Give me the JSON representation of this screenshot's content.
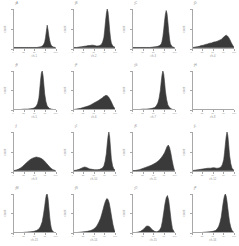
{
  "figure": {
    "title": "",
    "background": "#ffffff",
    "axis_color": "#a8a8a8",
    "fill_color": "#3a3a3a",
    "rows": 4,
    "cols": 4,
    "panel_count": 16
  },
  "chart_data": {
    "type": "area",
    "title": "",
    "xlabel": "",
    "ylabel": "",
    "grid": false,
    "legend": false,
    "layout": {
      "rows": 4,
      "cols": 4
    },
    "shared_axis": {
      "xlim": [
        0,
        100
      ],
      "ylim": [
        0,
        100
      ]
    },
    "panels": [
      {
        "id": "panel-1",
        "title": "A",
        "xlabel": "ch-1",
        "ylabel": "count",
        "ytop": "1",
        "xticks": [
          "0",
          "25",
          "50",
          "75",
          "100"
        ],
        "xtick_pos": [
          0,
          25,
          50,
          75,
          100
        ],
        "x": [
          0,
          5,
          10,
          15,
          20,
          25,
          30,
          35,
          40,
          45,
          50,
          55,
          60,
          65,
          68,
          71,
          74,
          76,
          78,
          80,
          82,
          84,
          86,
          88,
          90,
          92,
          95,
          100
        ],
        "y": [
          0,
          0,
          0,
          0,
          0,
          0,
          0,
          0,
          0,
          0,
          0,
          0,
          1,
          2,
          4,
          7,
          14,
          26,
          42,
          58,
          46,
          30,
          18,
          10,
          5,
          3,
          1,
          0
        ]
      },
      {
        "id": "panel-2",
        "title": "B",
        "xlabel": "ch-2",
        "ylabel": "count",
        "ytop": "1",
        "xticks": [
          "0",
          "25",
          "50",
          "75",
          "100"
        ],
        "xtick_pos": [
          0,
          25,
          50,
          75,
          100
        ],
        "x": [
          0,
          6,
          12,
          18,
          24,
          30,
          34,
          38,
          42,
          46,
          50,
          54,
          58,
          62,
          66,
          69,
          72,
          74,
          76,
          78,
          80,
          82,
          84,
          86,
          88,
          90,
          94,
          100
        ],
        "y": [
          0,
          0,
          1,
          2,
          3,
          4,
          5,
          5,
          6,
          6,
          5,
          4,
          4,
          5,
          8,
          14,
          26,
          45,
          68,
          88,
          100,
          92,
          70,
          44,
          24,
          11,
          3,
          0
        ]
      },
      {
        "id": "panel-3",
        "title": "C",
        "xlabel": "ch-3",
        "ylabel": "count",
        "ytop": "1",
        "xticks": [
          "0",
          "25",
          "50",
          "75",
          "100"
        ],
        "xtick_pos": [
          0,
          25,
          50,
          75,
          100
        ],
        "x": [
          0,
          8,
          16,
          24,
          32,
          40,
          48,
          54,
          60,
          64,
          68,
          70,
          72,
          74,
          76,
          78,
          80,
          82,
          84,
          86,
          88,
          90,
          93,
          96,
          100
        ],
        "y": [
          0,
          0,
          0,
          0,
          0,
          0,
          1,
          2,
          3,
          5,
          9,
          16,
          28,
          46,
          68,
          86,
          96,
          88,
          66,
          42,
          22,
          10,
          4,
          1,
          0
        ]
      },
      {
        "id": "panel-4",
        "title": "D",
        "xlabel": "ch-4",
        "ylabel": "count",
        "ytop": "1",
        "xticks": [
          "0",
          "25",
          "50",
          "75",
          "100"
        ],
        "xtick_pos": [
          0,
          25,
          50,
          75,
          100
        ],
        "x": [
          0,
          5,
          10,
          15,
          20,
          25,
          30,
          35,
          40,
          45,
          50,
          55,
          60,
          64,
          68,
          71,
          74,
          77,
          80,
          83,
          86,
          89,
          92,
          95,
          98,
          100
        ],
        "y": [
          0,
          1,
          2,
          3,
          5,
          6,
          8,
          9,
          11,
          12,
          14,
          15,
          17,
          19,
          21,
          24,
          27,
          30,
          32,
          30,
          26,
          20,
          13,
          7,
          2,
          0
        ]
      },
      {
        "id": "panel-5",
        "title": "E",
        "xlabel": "ch-5",
        "ylabel": "count",
        "ytop": "1",
        "xticks": [
          "0",
          "25",
          "50",
          "75",
          "100"
        ],
        "xtick_pos": [
          0,
          25,
          50,
          75,
          100
        ],
        "x": [
          0,
          8,
          16,
          24,
          32,
          40,
          46,
          50,
          54,
          57,
          60,
          62,
          64,
          66,
          68,
          70,
          72,
          74,
          77,
          80,
          85,
          90,
          95,
          100
        ],
        "y": [
          0,
          0,
          0,
          1,
          1,
          2,
          3,
          5,
          9,
          16,
          30,
          52,
          76,
          95,
          100,
          88,
          64,
          40,
          20,
          9,
          3,
          1,
          0,
          0
        ]
      },
      {
        "id": "panel-6",
        "title": "F",
        "xlabel": "ch-6",
        "ylabel": "count",
        "ytop": "1",
        "xticks": [
          "0",
          "25",
          "50",
          "75",
          "100"
        ],
        "xtick_pos": [
          0,
          25,
          50,
          75,
          100
        ],
        "x": [
          0,
          5,
          10,
          16,
          22,
          28,
          34,
          40,
          45,
          50,
          55,
          60,
          64,
          68,
          71,
          74,
          77,
          80,
          83,
          86,
          89,
          92,
          95,
          98,
          100
        ],
        "y": [
          0,
          1,
          2,
          3,
          5,
          7,
          9,
          12,
          15,
          18,
          21,
          24,
          27,
          30,
          33,
          35,
          37,
          36,
          33,
          28,
          22,
          15,
          8,
          3,
          0
        ]
      },
      {
        "id": "panel-7",
        "title": "G",
        "xlabel": "ch-7",
        "ylabel": "count",
        "ytop": "1",
        "xticks": [
          "0",
          "25",
          "50",
          "75",
          "100"
        ],
        "xtick_pos": [
          0,
          25,
          50,
          75,
          100
        ],
        "x": [
          0,
          8,
          16,
          24,
          32,
          40,
          46,
          52,
          56,
          60,
          63,
          66,
          68,
          70,
          72,
          74,
          76,
          78,
          81,
          84,
          88,
          92,
          96,
          100
        ],
        "y": [
          0,
          0,
          0,
          1,
          1,
          2,
          3,
          5,
          9,
          17,
          30,
          50,
          72,
          90,
          100,
          92,
          72,
          48,
          26,
          12,
          5,
          2,
          0,
          0
        ]
      },
      {
        "id": "panel-8",
        "title": "H",
        "xlabel": "ch-8",
        "ylabel": "count",
        "ytop": "1",
        "xticks": [
          "0",
          "25",
          "50",
          "75",
          "100"
        ],
        "xtick_pos": [
          0,
          25,
          50,
          75,
          100
        ],
        "x": [
          0,
          25,
          50,
          75,
          100
        ],
        "y": [
          0,
          0,
          0,
          0,
          0
        ]
      },
      {
        "id": "panel-9",
        "title": "I",
        "xlabel": "ch-9",
        "ylabel": "count",
        "ytop": "1",
        "xticks": [
          "0",
          "25",
          "50",
          "75",
          "100"
        ],
        "xtick_pos": [
          0,
          25,
          50,
          75,
          100
        ],
        "x": [
          0,
          5,
          10,
          15,
          20,
          25,
          30,
          35,
          40,
          45,
          50,
          54,
          58,
          62,
          66,
          70,
          74,
          78,
          82,
          86,
          90,
          94,
          97,
          100
        ],
        "y": [
          0,
          1,
          3,
          6,
          10,
          15,
          20,
          25,
          29,
          32,
          34,
          35,
          34,
          33,
          31,
          28,
          24,
          19,
          14,
          9,
          5,
          2,
          1,
          0
        ]
      },
      {
        "id": "panel-10",
        "title": "J",
        "xlabel": "ch-10",
        "ylabel": "count",
        "ytop": "1",
        "xticks": [
          "0",
          "25",
          "50",
          "75",
          "100"
        ],
        "xtick_pos": [
          0,
          25,
          50,
          75,
          100
        ],
        "x": [
          0,
          6,
          12,
          18,
          22,
          26,
          30,
          34,
          38,
          44,
          50,
          56,
          62,
          68,
          72,
          75,
          78,
          80,
          82,
          84,
          86,
          88,
          90,
          93,
          96,
          100
        ],
        "y": [
          0,
          1,
          3,
          6,
          8,
          9,
          8,
          6,
          4,
          3,
          2,
          2,
          3,
          6,
          12,
          24,
          44,
          68,
          88,
          100,
          86,
          58,
          30,
          12,
          4,
          0
        ]
      },
      {
        "id": "panel-11",
        "title": "K",
        "xlabel": "ch-11",
        "ylabel": "count",
        "ytop": "1",
        "xticks": [
          "0",
          "25",
          "50",
          "75",
          "100"
        ],
        "xtick_pos": [
          0,
          25,
          50,
          75,
          100
        ],
        "x": [
          0,
          5,
          10,
          15,
          20,
          25,
          30,
          35,
          40,
          45,
          50,
          55,
          60,
          64,
          68,
          72,
          76,
          79,
          82,
          85,
          88,
          91,
          94,
          97,
          100
        ],
        "y": [
          0,
          0,
          1,
          2,
          4,
          6,
          8,
          10,
          12,
          14,
          17,
          20,
          24,
          28,
          33,
          39,
          46,
          54,
          62,
          66,
          60,
          46,
          28,
          12,
          0
        ]
      },
      {
        "id": "panel-12",
        "title": "L",
        "xlabel": "ch-12",
        "ylabel": "count",
        "ytop": "1",
        "xticks": [
          "0",
          "25",
          "50",
          "75",
          "100"
        ],
        "xtick_pos": [
          0,
          25,
          50,
          75,
          100
        ],
        "x": [
          0,
          6,
          12,
          18,
          24,
          30,
          36,
          42,
          48,
          52,
          56,
          60,
          64,
          68,
          71,
          74,
          76,
          78,
          80,
          82,
          84,
          86,
          88,
          91,
          94,
          98,
          100
        ],
        "y": [
          0,
          1,
          2,
          3,
          4,
          5,
          6,
          6,
          7,
          7,
          6,
          6,
          7,
          10,
          16,
          28,
          46,
          68,
          88,
          100,
          90,
          66,
          40,
          18,
          6,
          1,
          0
        ]
      },
      {
        "id": "panel-13",
        "title": "M",
        "xlabel": "ch-13",
        "ylabel": "count",
        "ytop": "1",
        "xticks": [
          "0",
          "25",
          "50",
          "75",
          "100"
        ],
        "xtick_pos": [
          0,
          25,
          50,
          75,
          100
        ],
        "x": [
          0,
          10,
          20,
          30,
          40,
          48,
          54,
          60,
          64,
          68,
          71,
          74,
          76,
          78,
          80,
          82,
          84,
          86,
          88,
          90,
          92,
          95,
          98,
          100
        ],
        "y": [
          0,
          0,
          0,
          1,
          2,
          3,
          5,
          9,
          16,
          28,
          46,
          68,
          86,
          98,
          100,
          88,
          64,
          40,
          22,
          11,
          5,
          2,
          0,
          0
        ]
      },
      {
        "id": "panel-14",
        "title": "N",
        "xlabel": "ch-14",
        "ylabel": "count",
        "ytop": "1",
        "xticks": [
          "0",
          "25",
          "50",
          "75",
          "100"
        ],
        "xtick_pos": [
          0,
          25,
          50,
          75,
          100
        ],
        "x": [
          0,
          8,
          16,
          24,
          32,
          40,
          46,
          52,
          56,
          60,
          64,
          67,
          70,
          73,
          76,
          79,
          82,
          85,
          88,
          91,
          94,
          97,
          100
        ],
        "y": [
          0,
          0,
          1,
          2,
          3,
          5,
          8,
          13,
          19,
          27,
          37,
          48,
          60,
          72,
          82,
          88,
          86,
          76,
          58,
          38,
          20,
          7,
          0
        ]
      },
      {
        "id": "panel-15",
        "title": "O",
        "xlabel": "ch-15",
        "ylabel": "count",
        "ytop": "1",
        "xticks": [
          "0",
          "25",
          "50",
          "75",
          "100"
        ],
        "xtick_pos": [
          0,
          25,
          50,
          75,
          100
        ],
        "x": [
          0,
          6,
          12,
          18,
          24,
          28,
          32,
          36,
          40,
          44,
          48,
          52,
          56,
          60,
          64,
          68,
          71,
          74,
          77,
          80,
          83,
          86,
          89,
          92,
          95,
          100
        ],
        "y": [
          0,
          0,
          1,
          3,
          7,
          12,
          16,
          17,
          15,
          10,
          6,
          3,
          2,
          3,
          6,
          14,
          30,
          52,
          74,
          90,
          96,
          84,
          58,
          30,
          10,
          0
        ]
      },
      {
        "id": "panel-16",
        "title": "P",
        "xlabel": "ch-16",
        "ylabel": "count",
        "ytop": "1",
        "xticks": [
          "0",
          "25",
          "50",
          "75",
          "100"
        ],
        "xtick_pos": [
          0,
          25,
          50,
          75,
          100
        ],
        "x": [
          0,
          10,
          20,
          30,
          40,
          48,
          54,
          58,
          62,
          65,
          68,
          70,
          72,
          74,
          76,
          78,
          80,
          82,
          84,
          86,
          88,
          91,
          94,
          98,
          100
        ],
        "y": [
          0,
          0,
          0,
          1,
          2,
          3,
          5,
          9,
          16,
          26,
          40,
          56,
          72,
          86,
          96,
          100,
          94,
          80,
          62,
          44,
          28,
          14,
          5,
          1,
          0
        ]
      }
    ]
  }
}
